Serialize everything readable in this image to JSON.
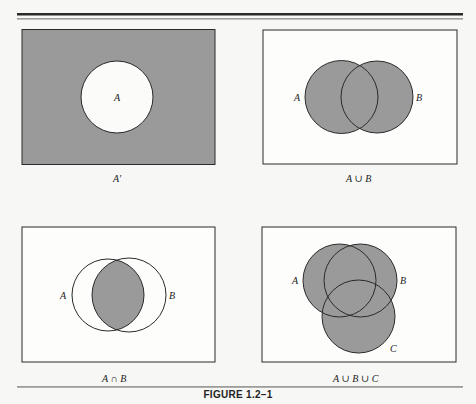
{
  "figure": {
    "title": "FIGURE 1.2–1",
    "colors": {
      "shade": "#9a9a9a",
      "stroke": "#2a2a2a",
      "background": "#f7f7f5",
      "panel_fill": "#ffffff"
    }
  },
  "panels": [
    {
      "id": "complement",
      "caption": "A′",
      "description": "Universe shaded except circle A",
      "labels": {
        "A": "A"
      }
    },
    {
      "id": "union",
      "caption": "A ∪ B",
      "description": "Both circles A and B fully shaded",
      "labels": {
        "A": "A",
        "B": "B"
      }
    },
    {
      "id": "intersection",
      "caption": "A ∩ B",
      "description": "Only the overlap of A and B shaded",
      "labels": {
        "A": "A",
        "B": "B"
      }
    },
    {
      "id": "union3",
      "caption": "A ∪ B ∪ C",
      "description": "All three circles A, B, C fully shaded",
      "labels": {
        "A": "A",
        "B": "B",
        "C": "C"
      }
    }
  ]
}
